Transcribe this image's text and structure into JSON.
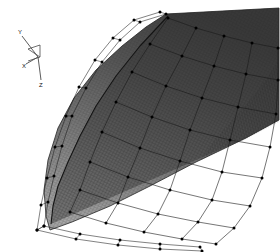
{
  "figure": {
    "kind": "3d-surface-mesh-viewport",
    "background_color": "#ffffff",
    "width": 280,
    "height": 252
  },
  "axis_triad": {
    "name": "coordinate-axis-triad",
    "origin": {
      "x": 38,
      "y": 57
    },
    "line_color": "#4a4a4a",
    "axes": [
      {
        "id": "y",
        "label": "Y",
        "tip": {
          "x": 22,
          "y": 36
        },
        "label_pos": {
          "x": 18,
          "y": 34
        }
      },
      {
        "id": "x",
        "label": "X",
        "tip": {
          "x": 26,
          "y": 64
        },
        "label_pos": {
          "x": 22,
          "y": 68
        }
      },
      {
        "id": "z",
        "label": "Z",
        "tip": {
          "x": 41,
          "y": 80
        },
        "label_pos": {
          "x": 39,
          "y": 87
        }
      }
    ]
  },
  "mesh": {
    "name": "hull-surface-mesh",
    "fine_mesh_color_dark": "#4a4a4a",
    "fine_mesh_color_mid": "#6e6e6e",
    "fine_mesh_color_light": "#9a9a9a",
    "control_line_color": "#1a1a1a",
    "control_node_color": "#000000",
    "control_node_radius": 1.5,
    "outline_color": "#2b2b2b",
    "surface_outline": [
      {
        "x": 166,
        "y": 14
      },
      {
        "x": 279,
        "y": 8
      },
      {
        "x": 279,
        "y": 120
      },
      {
        "x": 246,
        "y": 138
      },
      {
        "x": 196,
        "y": 162
      },
      {
        "x": 150,
        "y": 186
      },
      {
        "x": 110,
        "y": 206
      },
      {
        "x": 72,
        "y": 222
      },
      {
        "x": 50,
        "y": 230
      },
      {
        "x": 46,
        "y": 216
      },
      {
        "x": 44,
        "y": 190
      },
      {
        "x": 48,
        "y": 160
      },
      {
        "x": 58,
        "y": 128
      },
      {
        "x": 74,
        "y": 98
      },
      {
        "x": 96,
        "y": 70
      },
      {
        "x": 122,
        "y": 46
      },
      {
        "x": 146,
        "y": 27
      }
    ],
    "chine_crease": [
      {
        "x": 168,
        "y": 16
      },
      {
        "x": 140,
        "y": 46
      },
      {
        "x": 116,
        "y": 76
      },
      {
        "x": 96,
        "y": 106
      },
      {
        "x": 80,
        "y": 136
      },
      {
        "x": 68,
        "y": 162
      },
      {
        "x": 58,
        "y": 186
      },
      {
        "x": 53,
        "y": 206
      },
      {
        "x": 51,
        "y": 224
      }
    ],
    "shading_bands": [
      {
        "id": "topside",
        "tone": "#4f4f4f"
      },
      {
        "id": "midbody",
        "tone": "#6b6b6b"
      },
      {
        "id": "bilge",
        "tone": "#8e8e8e"
      }
    ]
  },
  "control_net": {
    "name": "nurbs-control-polygon",
    "u_lines": 9,
    "v_lines": 6,
    "node_count": 54,
    "u_curves": [
      [
        {
          "x": 168,
          "y": 18
        },
        {
          "x": 196,
          "y": 28
        },
        {
          "x": 224,
          "y": 36
        },
        {
          "x": 252,
          "y": 43
        },
        {
          "x": 278,
          "y": 48
        }
      ],
      [
        {
          "x": 150,
          "y": 44
        },
        {
          "x": 182,
          "y": 56
        },
        {
          "x": 214,
          "y": 66
        },
        {
          "x": 246,
          "y": 74
        },
        {
          "x": 278,
          "y": 80
        }
      ],
      [
        {
          "x": 132,
          "y": 72
        },
        {
          "x": 166,
          "y": 86
        },
        {
          "x": 202,
          "y": 98
        },
        {
          "x": 238,
          "y": 107
        },
        {
          "x": 276,
          "y": 114
        }
      ],
      [
        {
          "x": 116,
          "y": 102
        },
        {
          "x": 152,
          "y": 117
        },
        {
          "x": 190,
          "y": 130
        },
        {
          "x": 230,
          "y": 140
        },
        {
          "x": 270,
          "y": 147
        }
      ],
      [
        {
          "x": 102,
          "y": 132
        },
        {
          "x": 140,
          "y": 148
        },
        {
          "x": 180,
          "y": 161
        },
        {
          "x": 222,
          "y": 172
        },
        {
          "x": 262,
          "y": 178
        }
      ],
      [
        {
          "x": 90,
          "y": 162
        },
        {
          "x": 128,
          "y": 177
        },
        {
          "x": 170,
          "y": 190
        },
        {
          "x": 212,
          "y": 200
        },
        {
          "x": 250,
          "y": 206
        }
      ],
      [
        {
          "x": 80,
          "y": 190
        },
        {
          "x": 118,
          "y": 203
        },
        {
          "x": 158,
          "y": 214
        },
        {
          "x": 198,
          "y": 222
        },
        {
          "x": 234,
          "y": 228
        }
      ],
      [
        {
          "x": 70,
          "y": 212
        },
        {
          "x": 106,
          "y": 223
        },
        {
          "x": 144,
          "y": 232
        },
        {
          "x": 182,
          "y": 239
        },
        {
          "x": 216,
          "y": 244
        }
      ]
    ],
    "v_curves": [
      [
        {
          "x": 168,
          "y": 18
        },
        {
          "x": 150,
          "y": 44
        },
        {
          "x": 132,
          "y": 72
        },
        {
          "x": 116,
          "y": 102
        },
        {
          "x": 102,
          "y": 132
        },
        {
          "x": 90,
          "y": 162
        },
        {
          "x": 80,
          "y": 190
        },
        {
          "x": 70,
          "y": 212
        }
      ],
      [
        {
          "x": 196,
          "y": 28
        },
        {
          "x": 182,
          "y": 56
        },
        {
          "x": 166,
          "y": 86
        },
        {
          "x": 152,
          "y": 117
        },
        {
          "x": 140,
          "y": 148
        },
        {
          "x": 128,
          "y": 177
        },
        {
          "x": 118,
          "y": 203
        },
        {
          "x": 106,
          "y": 223
        }
      ],
      [
        {
          "x": 224,
          "y": 36
        },
        {
          "x": 214,
          "y": 66
        },
        {
          "x": 202,
          "y": 98
        },
        {
          "x": 190,
          "y": 130
        },
        {
          "x": 180,
          "y": 161
        },
        {
          "x": 170,
          "y": 190
        },
        {
          "x": 158,
          "y": 214
        },
        {
          "x": 144,
          "y": 232
        }
      ],
      [
        {
          "x": 252,
          "y": 43
        },
        {
          "x": 246,
          "y": 74
        },
        {
          "x": 238,
          "y": 107
        },
        {
          "x": 230,
          "y": 140
        },
        {
          "x": 222,
          "y": 172
        },
        {
          "x": 212,
          "y": 200
        },
        {
          "x": 198,
          "y": 222
        },
        {
          "x": 182,
          "y": 239
        }
      ],
      [
        {
          "x": 278,
          "y": 48
        },
        {
          "x": 278,
          "y": 80
        },
        {
          "x": 276,
          "y": 114
        },
        {
          "x": 270,
          "y": 147
        },
        {
          "x": 262,
          "y": 178
        },
        {
          "x": 250,
          "y": 206
        },
        {
          "x": 234,
          "y": 228
        },
        {
          "x": 216,
          "y": 244
        }
      ]
    ],
    "bow_polygon": [
      [
        {
          "x": 166,
          "y": 14
        },
        {
          "x": 140,
          "y": 22
        },
        {
          "x": 120,
          "y": 40
        },
        {
          "x": 102,
          "y": 62
        },
        {
          "x": 86,
          "y": 88
        },
        {
          "x": 72,
          "y": 116
        },
        {
          "x": 62,
          "y": 146
        },
        {
          "x": 54,
          "y": 176
        },
        {
          "x": 48,
          "y": 202
        },
        {
          "x": 44,
          "y": 226
        }
      ],
      [
        {
          "x": 160,
          "y": 12
        },
        {
          "x": 134,
          "y": 20
        },
        {
          "x": 113,
          "y": 38
        },
        {
          "x": 95,
          "y": 60
        },
        {
          "x": 79,
          "y": 87
        },
        {
          "x": 66,
          "y": 116
        },
        {
          "x": 55,
          "y": 147
        },
        {
          "x": 47,
          "y": 178
        },
        {
          "x": 41,
          "y": 205
        },
        {
          "x": 37,
          "y": 230
        }
      ]
    ],
    "keel_polygon": [
      [
        {
          "x": 44,
          "y": 226
        },
        {
          "x": 80,
          "y": 234
        },
        {
          "x": 120,
          "y": 240
        },
        {
          "x": 160,
          "y": 244
        },
        {
          "x": 200,
          "y": 247
        }
      ],
      [
        {
          "x": 37,
          "y": 230
        },
        {
          "x": 76,
          "y": 239
        },
        {
          "x": 118,
          "y": 245
        },
        {
          "x": 160,
          "y": 249
        },
        {
          "x": 202,
          "y": 251
        }
      ]
    ]
  }
}
